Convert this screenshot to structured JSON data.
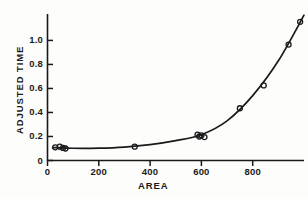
{
  "chart_data": {
    "type": "scatter",
    "title": "",
    "subtitle": "",
    "xlabel": "AREA",
    "ylabel": "ADJUSTED TIME",
    "xlim": [
      0,
      1000
    ],
    "ylim": [
      0,
      1.22
    ],
    "grid": false,
    "legend": null,
    "xticks": [
      0,
      200,
      400,
      600,
      800
    ],
    "xtick_labels": [
      "0",
      "200",
      "400",
      "600",
      "800"
    ],
    "yticks": [
      0,
      0.2,
      0.4,
      0.6,
      0.8,
      1.0
    ],
    "ytick_labels": [
      "0",
      "0.2",
      "0.4",
      "0.6",
      "0.8",
      "1.0"
    ],
    "marker": "open-circle",
    "points": [
      {
        "x": 30,
        "y": 0.11
      },
      {
        "x": 48,
        "y": 0.115
      },
      {
        "x": 60,
        "y": 0.105
      },
      {
        "x": 70,
        "y": 0.1
      },
      {
        "x": 340,
        "y": 0.115
      },
      {
        "x": 585,
        "y": 0.215
      },
      {
        "x": 592,
        "y": 0.2
      },
      {
        "x": 600,
        "y": 0.21
      },
      {
        "x": 612,
        "y": 0.195
      },
      {
        "x": 750,
        "y": 0.435
      },
      {
        "x": 843,
        "y": 0.625
      },
      {
        "x": 940,
        "y": 0.965
      },
      {
        "x": 985,
        "y": 1.155
      }
    ],
    "fit_curve": {
      "name": "fitted curve",
      "x": [
        20,
        100,
        200,
        300,
        400,
        500,
        600,
        700,
        800,
        900,
        1000
      ],
      "y": [
        0.108,
        0.102,
        0.103,
        0.112,
        0.132,
        0.165,
        0.215,
        0.33,
        0.54,
        0.83,
        1.21
      ]
    }
  },
  "axes": {
    "y_axis_name": "y-axis",
    "x_axis_name": "x-axis"
  }
}
